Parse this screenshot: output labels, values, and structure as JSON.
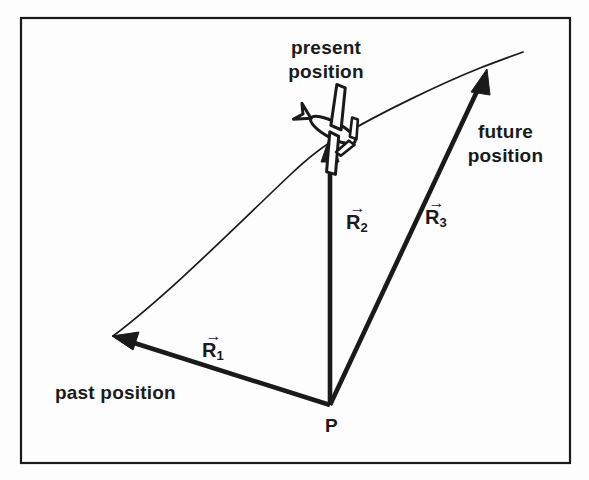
{
  "figure": {
    "background_color": "#fdfdfd",
    "ink_color": "#1a1a1a",
    "border": {
      "name": "figure-border",
      "x": 21,
      "y": 18,
      "width": 549,
      "height": 445,
      "stroke_width": 2.2
    }
  },
  "annotations": {
    "present_position": "present\nposition",
    "present_position_line1": "present",
    "present_position_line2": "position",
    "future_position_line1": "future",
    "future_position_line2": "position",
    "past_position": "past position",
    "point_label": "P"
  },
  "vectors": {
    "r1": {
      "base": "R",
      "subscript": "1",
      "arrow": "→",
      "from": "P",
      "to": "past position",
      "start": [
        330,
        405
      ],
      "end": [
        113,
        336
      ]
    },
    "r2": {
      "base": "R",
      "subscript": "2",
      "arrow": "→",
      "from": "P",
      "to": "present position",
      "start": [
        330,
        405
      ],
      "end": [
        330,
        137
      ]
    },
    "r3": {
      "base": "R",
      "subscript": "3",
      "arrow": "→",
      "from": "P",
      "to": "future position",
      "start": [
        330,
        405
      ],
      "end": [
        487,
        70
      ]
    }
  },
  "trajectory": {
    "name": "flight-path-curve",
    "description": "curved flight path from past position through present position to future position",
    "start": [
      113,
      336
    ],
    "through": [
      330,
      148
    ],
    "end": [
      523,
      52
    ],
    "stroke_width": 1.6
  },
  "aircraft": {
    "name": "airplane-icon",
    "position": [
      333,
      130
    ],
    "heading_deg": 28,
    "description": "top view of airplane on flight path at present position"
  }
}
